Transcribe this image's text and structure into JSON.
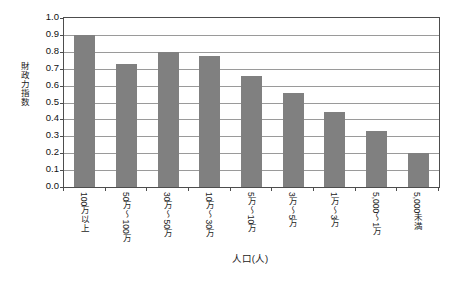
{
  "chart_data": {
    "type": "bar",
    "title": "",
    "subtitle": "",
    "xlabel": "人口(人)",
    "ylabel": "財政力指数",
    "categories": [
      "100万以上",
      "50万～100万",
      "30万～50万",
      "10万～30万",
      "5万～10万",
      "3万～5万",
      "1万～3万",
      "5,000～1万",
      "5,000未満"
    ],
    "values": [
      0.9,
      0.73,
      0.8,
      0.775,
      0.655,
      0.555,
      0.445,
      0.33,
      0.2
    ],
    "series": [
      {
        "name": "財政力指数",
        "values": [
          0.9,
          0.73,
          0.8,
          0.775,
          0.655,
          0.555,
          0.445,
          0.33,
          0.2
        ]
      }
    ],
    "ylim": [
      0.0,
      1.0
    ],
    "ytick_step": 0.1,
    "ytick_labels": [
      "1.0",
      "0.9",
      "0.8",
      "0.7",
      "0.6",
      "0.5",
      "0.4",
      "0.3",
      "0.2",
      "0.1",
      "0.0"
    ],
    "ytick_values": [
      1.0,
      0.9,
      0.8,
      0.7,
      0.6,
      0.5,
      0.4,
      0.3,
      0.2,
      0.1,
      0.0
    ],
    "grid": true,
    "grid_axis": "y",
    "legend": false,
    "legend_position": "none",
    "bar_color": "#808080",
    "grid_color": "#9a9a9a",
    "axis_color": "#4d4d4d",
    "background_color": "#ffffff",
    "annotations": []
  }
}
